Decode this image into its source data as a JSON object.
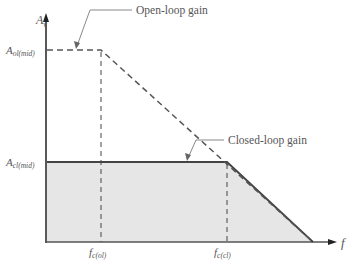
{
  "diagram": {
    "y_axis_label": "A",
    "y_axis_sub": "v",
    "x_axis_label": "f",
    "levels": {
      "open_loop": {
        "label": "A",
        "sub": "ol(mid)"
      },
      "closed_loop": {
        "label": "A",
        "sub": "cl(mid)"
      }
    },
    "cutoffs": {
      "open_loop": {
        "label": "f",
        "sub": "c(ol)"
      },
      "closed_loop": {
        "label": "f",
        "sub": "c(cl)"
      }
    },
    "callouts": {
      "open_loop": "Open-loop gain",
      "closed_loop": "Closed-loop gain"
    },
    "colors": {
      "axis": "#222222",
      "open_loop_line": "#555555",
      "closed_loop_line": "#444444",
      "fill": "#e6e6e6",
      "text": "#555555"
    }
  }
}
